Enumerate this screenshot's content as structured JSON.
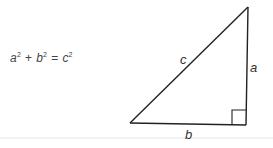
{
  "equation": {
    "a": "a",
    "a_exp": "2",
    "plus": "+",
    "b": "b",
    "b_exp": "2",
    "equals": "=",
    "c": "c",
    "c_exp": "2"
  },
  "triangle": {
    "labels": {
      "hypotenuse": "c",
      "vertical_leg": "a",
      "horizontal_leg": "b"
    },
    "right_angle_marker": true,
    "stroke_color": "#222222"
  },
  "divider_color": "#e6e6e6"
}
